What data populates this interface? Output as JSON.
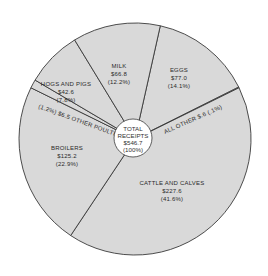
{
  "chart_data": {
    "type": "pie",
    "title": "",
    "center_label": {
      "line1": "TOTAL",
      "line2": "RECEIPTS",
      "line3": "$546.7",
      "line4": "(100%)"
    },
    "total": 546.7,
    "start_angle_deg": 12.6,
    "slices": [
      {
        "name": "EGGS",
        "value": 77.0,
        "value_label": "$77.0",
        "percent": 14.1,
        "percent_label": "(14.1%)"
      },
      {
        "name": "ALL OTHER",
        "value": 0.6,
        "value_label": "$.6",
        "percent": 0.1,
        "percent_label": "(.1%)"
      },
      {
        "name": "CATTLE AND CALVES",
        "value": 227.6,
        "value_label": "$227.6",
        "percent": 41.6,
        "percent_label": "(41.6%)"
      },
      {
        "name": "BROILERS",
        "value": 125.2,
        "value_label": "$125.2",
        "percent": 22.9,
        "percent_label": "(22.9%)"
      },
      {
        "name": "OTHER POULTRY",
        "value": 6.5,
        "value_label": "$6.5",
        "percent": 1.2,
        "percent_label": "(1.2%)"
      },
      {
        "name": "HOGS AND PIGS",
        "value": 42.6,
        "value_label": "$42.6",
        "percent": 7.8,
        "percent_label": "(7.8%)"
      },
      {
        "name": "MILK",
        "value": 66.8,
        "value_label": "$66.8",
        "percent": 12.2,
        "percent_label": "(12.2%)"
      }
    ],
    "colors": {
      "slice_fill": "#d9d9d9",
      "slice_stroke": "#3a3a3a",
      "center_fill": "#ffffff",
      "text": "#2a2a2a"
    }
  },
  "labels": {
    "milk": {
      "name": "MILK",
      "value": "$66.8",
      "pct": "(12.2%)"
    },
    "eggs": {
      "name": "EGGS",
      "value": "$77.0",
      "pct": "(14.1%)"
    },
    "hogs": {
      "name": "HOGS AND PIGS",
      "value": "$42.6",
      "pct": "(7.8%)"
    },
    "broilers": {
      "name": "BROILERS",
      "value": "$125.2",
      "pct": "(22.9%)"
    },
    "cattle": {
      "name": "CATTLE AND CALVES",
      "value": "$227.6",
      "pct": "(41.6%)"
    },
    "other_poultry": {
      "text": "(1.2%)   $6.5   OTHER POULTRY"
    },
    "all_other": {
      "text": "ALL OTHER    $.6    (.1%)"
    },
    "center": {
      "line1": "TOTAL",
      "line2": "RECEIPTS",
      "line3": "$546.7",
      "line4": "(100%)"
    }
  }
}
